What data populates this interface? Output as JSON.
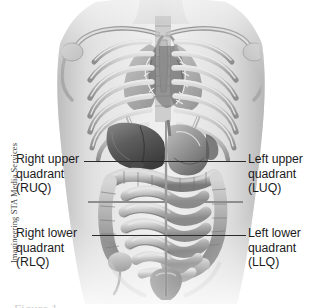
{
  "figure": {
    "credit": "Imagineering STA Media Services",
    "caption_partial": "Figure 1",
    "alt": "Anterior view of human torso showing skeletal rib cage and abdominal organs divided into four quadrants"
  },
  "labels": {
    "ruq": {
      "line1": "Right upper",
      "line2": "quadrant",
      "line3": "(RUQ)",
      "abbr": "RUQ"
    },
    "luq": {
      "line1": "Left upper",
      "line2": "quadrant",
      "line3": "(LUQ)",
      "abbr": "LUQ"
    },
    "rlq": {
      "line1": "Right lower",
      "line2": "quadrant",
      "line3": "(RLQ)",
      "abbr": "RLQ"
    },
    "llq": {
      "line1": "Left lower",
      "line2": "quadrant",
      "line3": "(LLQ)",
      "abbr": "LLQ"
    }
  },
  "colors": {
    "background": "#ffffff",
    "text": "#1c1c1c",
    "leader_line": "#2b2b2b",
    "divider_line": "#8d8d8d",
    "skin_light": "#e7e7e7",
    "bone": "#c8c8c8",
    "organ_mid": "#a8a8a8",
    "organ_dark": "#6f6f6f",
    "shadow": "#4a4a4a"
  },
  "illustration": {
    "parts": [
      "clavicle-left",
      "clavicle-right",
      "scapula-left",
      "scapula-right",
      "sternum",
      "rib-cage",
      "vertebral-column",
      "lung-left",
      "lung-right",
      "heart-shadow",
      "liver",
      "stomach",
      "transverse-colon",
      "ascending-colon",
      "descending-colon",
      "small-intestine",
      "cecum",
      "sigmoid-colon",
      "urinary-bladder"
    ]
  }
}
